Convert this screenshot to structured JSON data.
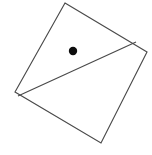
{
  "figure": {
    "background_color": "#ffffff",
    "stroke_color": "#4a4a4a",
    "fill_color": "#ffffff",
    "point_color": "#0d0d0d",
    "canvas": {
      "width": 152,
      "height": 155
    },
    "shapes": {
      "quadrilateral": {
        "name": "tilted-square",
        "vertices": [
          {
            "label": "top",
            "x": 65,
            "y": 3
          },
          {
            "label": "right",
            "x": 147,
            "y": 52
          },
          {
            "label": "bottom",
            "x": 101,
            "y": 143
          },
          {
            "label": "left",
            "x": 15,
            "y": 92
          }
        ],
        "points_attr": "65,3 147,52 101,143 15,92"
      },
      "diagonal": {
        "name": "interior-diagonal",
        "from": {
          "x": 18,
          "y": 96
        },
        "to": {
          "x": 136,
          "y": 42
        }
      },
      "dot": {
        "name": "marked-point",
        "cx": 73,
        "cy": 51,
        "r": 4.2
      }
    }
  }
}
